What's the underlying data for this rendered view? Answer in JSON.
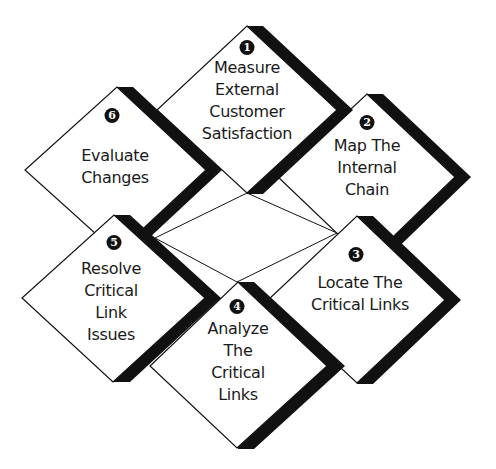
{
  "diagram": {
    "type": "process-cycle",
    "top_cut_text": "Process",
    "steps": [
      {
        "number": "1",
        "label": "Measure\nExternal\nCustomer\nSatisfaction"
      },
      {
        "number": "2",
        "label": "Map The\nInternal\nChain"
      },
      {
        "number": "3",
        "label": "Locate The\nCritical Links"
      },
      {
        "number": "4",
        "label": "Analyze\nThe\nCritical\nLinks"
      },
      {
        "number": "5",
        "label": "Resolve\nCritical\nLink\nIssues"
      },
      {
        "number": "6",
        "label": "Evaluate\nChanges"
      }
    ],
    "colors": {
      "fill": "#ffffff",
      "outline": "#111111",
      "shadow": "#111111",
      "text": "#1a1a1a"
    }
  }
}
